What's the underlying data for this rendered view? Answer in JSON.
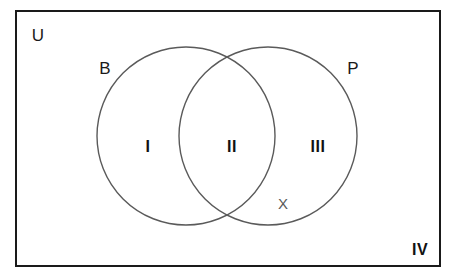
{
  "diagram": {
    "type": "venn-two-set",
    "title_visible": false,
    "universe": {
      "label": "U",
      "corner_label": "IV",
      "x": 38,
      "y": 35,
      "corner_x": 420,
      "corner_y": 250,
      "rect": {
        "x": 16,
        "y": 11,
        "width": 424,
        "height": 255
      },
      "border_color": "#1a1a1a",
      "border_width": 2,
      "fill": "#ffffff"
    },
    "circles": [
      {
        "label": "B",
        "label_x": 105,
        "label_y": 68,
        "cx": 186,
        "cy": 136,
        "r": 89,
        "stroke": "#5a5a5a",
        "stroke_width": 1.4,
        "fill": "none"
      },
      {
        "label": "P",
        "label_x": 353,
        "label_y": 68,
        "cx": 268,
        "cy": 136,
        "r": 89,
        "stroke": "#5a5a5a",
        "stroke_width": 1.4,
        "fill": "none"
      }
    ],
    "regions": [
      {
        "label": "I",
        "meaning": "B only",
        "x": 148,
        "y": 147
      },
      {
        "label": "II",
        "meaning": "B and P",
        "x": 232,
        "y": 147
      },
      {
        "label": "III",
        "meaning": "P only",
        "x": 318,
        "y": 147
      },
      {
        "label": "IV",
        "meaning": "neither B nor P",
        "x": 420,
        "y": 250
      }
    ],
    "points": [
      {
        "label": "X",
        "x": 283,
        "y": 203,
        "color": "#5a5a5a",
        "region": "III"
      }
    ]
  }
}
